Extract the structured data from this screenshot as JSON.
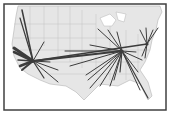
{
  "map": {
    "title": "",
    "colors": {
      "background": "#ffffff",
      "land": "#e6e6e6",
      "water": "#ffffff",
      "borders": "#b4b4b4",
      "flows": "#3c3c3c",
      "frame": "#404040"
    },
    "frame": {
      "x": 4,
      "y": 4,
      "w": 162,
      "h": 106
    },
    "hubs": [
      {
        "name": "west",
        "x": 33,
        "y": 61
      },
      {
        "name": "central",
        "x": 122,
        "y": 51
      },
      {
        "name": "east",
        "x": 147,
        "y": 44
      }
    ],
    "flows": [
      {
        "from": "west",
        "x": 22,
        "y": 10,
        "w": 1.5
      },
      {
        "from": "west",
        "x": 20,
        "y": 18,
        "w": 1.2
      },
      {
        "from": "west",
        "x": 44,
        "y": 42,
        "w": 1
      },
      {
        "from": "west",
        "x": 14,
        "y": 48,
        "w": 3
      },
      {
        "from": "west",
        "x": 14,
        "y": 52,
        "w": 2.5
      },
      {
        "from": "west",
        "x": 18,
        "y": 60,
        "w": 1.5
      },
      {
        "from": "west",
        "x": 20,
        "y": 66,
        "w": 2.5
      },
      {
        "from": "west",
        "x": 22,
        "y": 70,
        "w": 2
      },
      {
        "from": "west",
        "x": 44,
        "y": 78,
        "w": 1.2
      },
      {
        "from": "west",
        "x": 58,
        "y": 82,
        "w": 1
      },
      {
        "from": "west",
        "x": 58,
        "y": 70,
        "w": 1
      },
      {
        "from": "west",
        "x": 50,
        "y": 62,
        "w": 1
      },
      {
        "from": "west",
        "x": 147,
        "y": 44,
        "w": 1.5
      },
      {
        "from": "west",
        "x": 122,
        "y": 51,
        "w": 2
      },
      {
        "from": "central",
        "x": 98,
        "y": 29,
        "w": 1
      },
      {
        "from": "central",
        "x": 108,
        "y": 30,
        "w": 1
      },
      {
        "from": "central",
        "x": 117,
        "y": 32,
        "w": 1
      },
      {
        "from": "central",
        "x": 90,
        "y": 45,
        "w": 1
      },
      {
        "from": "central",
        "x": 65,
        "y": 51,
        "w": 1
      },
      {
        "from": "central",
        "x": 70,
        "y": 66,
        "w": 1
      },
      {
        "from": "central",
        "x": 86,
        "y": 75,
        "w": 1
      },
      {
        "from": "central",
        "x": 88,
        "y": 80,
        "w": 1
      },
      {
        "from": "central",
        "x": 90,
        "y": 88,
        "w": 1
      },
      {
        "from": "central",
        "x": 100,
        "y": 86,
        "w": 1
      },
      {
        "from": "central",
        "x": 110,
        "y": 86,
        "w": 1
      },
      {
        "from": "central",
        "x": 114,
        "y": 80,
        "w": 1
      },
      {
        "from": "central",
        "x": 120,
        "y": 72,
        "w": 1.2
      },
      {
        "from": "central",
        "x": 140,
        "y": 90,
        "w": 1
      },
      {
        "from": "central",
        "x": 148,
        "y": 98,
        "w": 1.2
      },
      {
        "from": "central",
        "x": 138,
        "y": 72,
        "w": 1
      },
      {
        "from": "central",
        "x": 142,
        "y": 60,
        "w": 1
      },
      {
        "from": "central",
        "x": 136,
        "y": 52,
        "w": 1
      },
      {
        "from": "east",
        "x": 140,
        "y": 30,
        "w": 1
      },
      {
        "from": "east",
        "x": 146,
        "y": 28,
        "w": 1
      },
      {
        "from": "east",
        "x": 153,
        "y": 30,
        "w": 1
      },
      {
        "from": "east",
        "x": 158,
        "y": 28,
        "w": 1
      },
      {
        "from": "east",
        "x": 145,
        "y": 58,
        "w": 1
      },
      {
        "from": "east",
        "x": 142,
        "y": 56,
        "w": 1
      }
    ]
  }
}
